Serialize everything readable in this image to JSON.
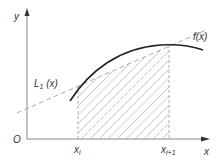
{
  "figure": {
    "labels": {
      "y_axis": "y",
      "x_axis": "x",
      "origin": "O",
      "curve": "f(x)",
      "line_main": "L",
      "line_sub": "1",
      "line_arg": " (x)",
      "xi_main": "x",
      "xi_sub": "i",
      "xi1_main": "x",
      "xi1_sub": "i+1"
    },
    "colors": {
      "curve": "#222222",
      "axis": "#888888",
      "dashed": "#aaaaaa",
      "hatch": "#bbbbbb"
    }
  }
}
